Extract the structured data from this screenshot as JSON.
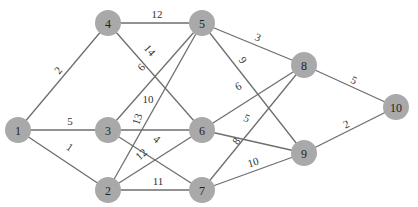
{
  "diagram": {
    "type": "weighted-undirected-graph",
    "node_color": "#a9a9a9",
    "edge_color": "#6e6e6e",
    "node_radius": 13,
    "nodes": [
      {
        "id": "1",
        "label": "1",
        "x": 18,
        "y": 130
      },
      {
        "id": "2",
        "label": "2",
        "x": 108,
        "y": 190
      },
      {
        "id": "3",
        "label": "3",
        "x": 108,
        "y": 130
      },
      {
        "id": "4",
        "label": "4",
        "x": 108,
        "y": 23
      },
      {
        "id": "5",
        "label": "5",
        "x": 202,
        "y": 23
      },
      {
        "id": "6",
        "label": "6",
        "x": 202,
        "y": 130
      },
      {
        "id": "7",
        "label": "7",
        "x": 202,
        "y": 190
      },
      {
        "id": "8",
        "label": "8",
        "x": 304,
        "y": 65
      },
      {
        "id": "9",
        "label": "9",
        "x": 304,
        "y": 153
      },
      {
        "id": "10",
        "label": "10",
        "x": 396,
        "y": 107
      }
    ],
    "edges": [
      {
        "from": "1",
        "to": "4",
        "weight": "2",
        "lx": 58,
        "ly": 70,
        "rot": -50
      },
      {
        "from": "1",
        "to": "3",
        "weight": "5",
        "lx": 70,
        "ly": 121,
        "rot": 0
      },
      {
        "from": "1",
        "to": "2",
        "weight": "1",
        "lx": 70,
        "ly": 147,
        "rot": 34
      },
      {
        "from": "4",
        "to": "5",
        "weight": "12",
        "lx": 157,
        "ly": 14,
        "rot": 0
      },
      {
        "from": "4",
        "to": "6",
        "weight": "14",
        "lx": 150,
        "ly": 50,
        "rot": 48
      },
      {
        "from": "3",
        "to": "5",
        "weight": "6",
        "lx": 141,
        "ly": 67,
        "rot": -48
      },
      {
        "from": "3",
        "to": "6",
        "weight": "10",
        "lx": 148,
        "ly": 99,
        "rot": 0
      },
      {
        "from": "3",
        "to": "7",
        "weight": "4",
        "lx": 157,
        "ly": 139,
        "rot": 40
      },
      {
        "from": "2",
        "to": "5",
        "weight": "13",
        "lx": 137,
        "ly": 119,
        "rot": -72
      },
      {
        "from": "2",
        "to": "6",
        "weight": "12",
        "lx": 141,
        "ly": 154,
        "rot": -42
      },
      {
        "from": "2",
        "to": "7",
        "weight": "11",
        "lx": 158,
        "ly": 181,
        "rot": 0
      },
      {
        "from": "5",
        "to": "8",
        "weight": "3",
        "lx": 258,
        "ly": 37,
        "rot": 22
      },
      {
        "from": "5",
        "to": "9",
        "weight": "9",
        "lx": 243,
        "ly": 60,
        "rot": 55
      },
      {
        "from": "6",
        "to": "8",
        "weight": "6",
        "lx": 238,
        "ly": 86,
        "rot": -28
      },
      {
        "from": "6",
        "to": "9",
        "weight": "5",
        "lx": 247,
        "ly": 118,
        "rot": 24
      },
      {
        "from": "7",
        "to": "8",
        "weight": "8",
        "lx": 236,
        "ly": 141,
        "rot": -55
      },
      {
        "from": "7",
        "to": "9",
        "weight": "10",
        "lx": 253,
        "ly": 162,
        "rot": -18
      },
      {
        "from": "8",
        "to": "10",
        "weight": "5",
        "lx": 354,
        "ly": 80,
        "rot": 27
      },
      {
        "from": "9",
        "to": "10",
        "weight": "2",
        "lx": 346,
        "ly": 124,
        "rot": -25
      }
    ]
  }
}
